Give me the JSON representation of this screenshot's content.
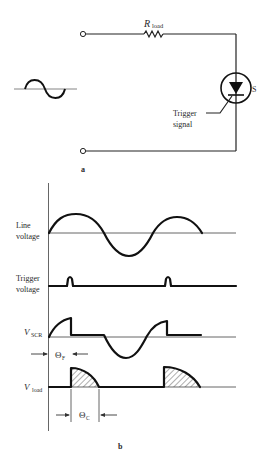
{
  "figure_a": {
    "label": "a",
    "resistor_label_main": "R",
    "resistor_label_sub": "load",
    "trigger_label_line1": "Trigger",
    "trigger_label_line2": "signal",
    "scr_label": "S",
    "source_symbol": "ac-source-sine-icon"
  },
  "figure_b": {
    "label": "b",
    "traces": [
      {
        "id": "line",
        "label_line1": "Line",
        "label_line2": "voltage"
      },
      {
        "id": "trigger",
        "label_line1": "Trigger",
        "label_line2": "voltage"
      },
      {
        "id": "vscr",
        "label_main": "V",
        "label_sub": "SCR"
      },
      {
        "id": "vload",
        "label_main": "V",
        "label_sub": "load"
      }
    ],
    "theta_f": {
      "main": "Θ",
      "sub": "F"
    },
    "theta_c": {
      "main": "Θ",
      "sub": "C"
    }
  },
  "colors": {
    "ink": "#111111",
    "background": "#ffffff",
    "axis": "#555555"
  }
}
